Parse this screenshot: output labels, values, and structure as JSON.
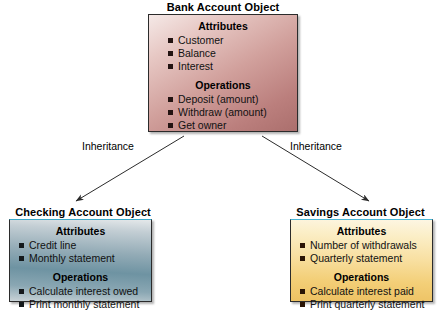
{
  "diagram": {
    "type": "uml-inheritance-class-diagram",
    "nodes": [
      {
        "id": "bank-account",
        "title": "Bank Account Object",
        "sections": [
          {
            "heading": "Attributes",
            "items": [
              "Customer",
              "Balance",
              "Interest"
            ]
          },
          {
            "heading": "Operations",
            "items": [
              "Deposit (amount)",
              "Withdraw (amount)",
              "Get owner"
            ]
          }
        ],
        "fill_start": "#f5e9e7",
        "fill_end": "#ab6f6d",
        "border": "#2b2b2b"
      },
      {
        "id": "checking-account",
        "title": "Checking Account Object",
        "sections": [
          {
            "heading": "Attributes",
            "items": [
              "Credit line",
              "Monthly statement"
            ]
          },
          {
            "heading": "Operations",
            "items": [
              "Calculate interest owed",
              "Print monthly statement"
            ]
          }
        ],
        "fill_start": "#e4e8ea",
        "fill_end": "#c9d3d7",
        "border": "#2b2b2b"
      },
      {
        "id": "savings-account",
        "title": "Savings Account Object",
        "sections": [
          {
            "heading": "Attributes",
            "items": [
              "Number of withdrawals",
              "Quarterly statement"
            ]
          },
          {
            "heading": "Operations",
            "items": [
              "Calculate interest paid",
              "Print quarterly statement"
            ]
          }
        ],
        "fill_start": "#fdf6e3",
        "fill_end": "#edc162",
        "border": "#2b2b2b"
      }
    ],
    "edges": [
      {
        "id": "edge-left",
        "label": "Inheritance",
        "from": "bank-account",
        "to": "checking-account"
      },
      {
        "id": "edge-right",
        "label": "Inheritance",
        "from": "bank-account",
        "to": "savings-account"
      }
    ]
  }
}
